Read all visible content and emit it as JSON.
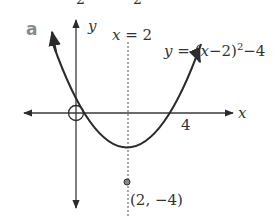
{
  "part_label": "a",
  "top_cropped_digits": [
    "2",
    "2"
  ],
  "axes": {
    "x_label": "x",
    "y_label": "y"
  },
  "equation_label": "y = (x−2)²−4",
  "eq_parts": {
    "y": "y",
    "eq": " = (",
    "x": "x",
    "mid": "−2)",
    "sup": "2",
    "tail": "−4"
  },
  "symmetry_line": {
    "label_x": "x",
    "label_rest": " = 2"
  },
  "x_intercept_label": "4",
  "vertex_label": "(2, −4)",
  "colors": {
    "curve": "#2b2b2b",
    "axis": "#3a3a3a",
    "text": "#333333",
    "part_label": "#8a8a8a"
  }
}
